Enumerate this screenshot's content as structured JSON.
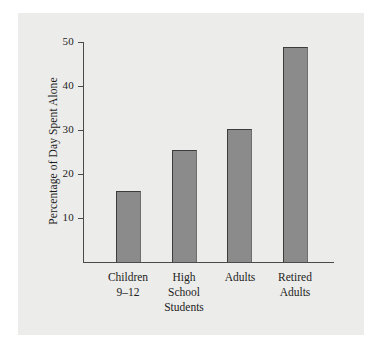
{
  "chart_data": {
    "type": "bar",
    "title": "",
    "subtitle": "",
    "xlabel": "",
    "ylabel": "Percentage of Day Spent Alone",
    "ylim": [
      0,
      50
    ],
    "yticks": [
      10,
      20,
      30,
      40,
      50
    ],
    "ytick_labels": [
      "10",
      "20",
      "30",
      "40",
      "50"
    ],
    "grid": false,
    "legend": null,
    "categories": [
      "Children 9–12",
      "High School Students",
      "Adults",
      "Retired Adults"
    ],
    "category_lines": [
      [
        "Children",
        "9–12"
      ],
      [
        "High",
        "School",
        "Students"
      ],
      [
        "Adults"
      ],
      [
        "Retired",
        "Adults"
      ]
    ],
    "values": [
      16.3,
      25.5,
      30.3,
      49.0
    ],
    "bar_color": "#8b8b8b",
    "bar_edge_color": "#3c3c3c",
    "background_color": "#ececea",
    "text_color": "#1d1d1d",
    "axis_color": "#4a4a4a"
  }
}
